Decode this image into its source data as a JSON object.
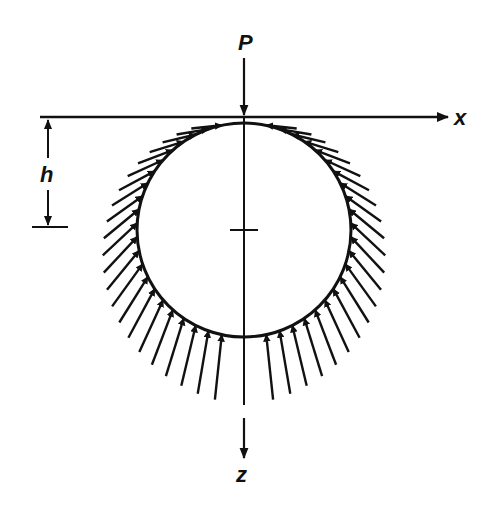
{
  "figure": {
    "labels": {
      "load": "P",
      "x_axis": "x",
      "z_axis": "z",
      "depth": "h"
    },
    "geometry": {
      "circle_center": [
        244,
        230
      ],
      "circle_radius": 107,
      "surface_y": 117,
      "arrows_per_side": 22
    },
    "colors": {
      "ink": "#111111",
      "background": "#ffffff"
    }
  }
}
